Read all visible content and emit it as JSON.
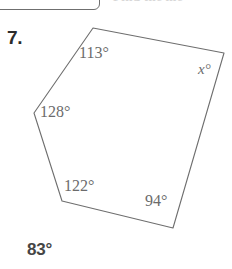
{
  "page": {
    "background_color": "#ffffff",
    "width": 232,
    "height": 269
  },
  "top_strip": {
    "tab_glyph": "•",
    "cut_off_heading": "Find the me"
  },
  "problem": {
    "number_label": "7.",
    "answer_label": "83°"
  },
  "figure": {
    "type": "polygon",
    "sides": 6,
    "name": "hexagon",
    "stroke_color": "#6e6e6e",
    "stroke_width": 1.1,
    "fill_color": "#ffffff",
    "vertices": [
      {
        "name": "top",
        "x": 93,
        "y": 28
      },
      {
        "name": "top-right",
        "x": 224,
        "y": 53
      },
      {
        "name": "bottom-right",
        "x": 173,
        "y": 228
      },
      {
        "name": "bottom-left",
        "x": 62,
        "y": 201
      },
      {
        "name": "left",
        "x": 34,
        "y": 113
      }
    ],
    "points_attr": "93,28 224,53 173,228 62,201 34,113"
  },
  "angles": {
    "top": "113°",
    "top_right": "x°",
    "left": "128°",
    "bottom_left": "122°",
    "bottom_right": "94°"
  },
  "chart_data": {
    "type": "diagram",
    "shape": "pentagon",
    "known_angles": [
      113,
      128,
      122,
      94
    ],
    "unknown_angle": "x",
    "answer": 83,
    "labels": [
      "113°",
      "x°",
      "128°",
      "122°",
      "94°"
    ],
    "annotations": [
      "7.",
      "83°"
    ]
  }
}
